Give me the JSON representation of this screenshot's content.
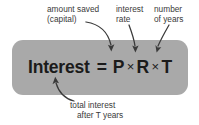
{
  "canvas": {
    "width": 199,
    "height": 125,
    "background": "#ffffff"
  },
  "formula_box": {
    "fill": "#a9a9a9",
    "corner_radius": 11
  },
  "formula": {
    "subject": "Interest",
    "equals": "=",
    "principal": "P",
    "times_1": "×",
    "rate": "R",
    "times_2": "×",
    "time": "T",
    "full_text": "Interest = P × R × T",
    "text_color": "#1b1b1b"
  },
  "callouts": {
    "capital": {
      "line1": "amount saved",
      "line2": "(capital)",
      "points_to": "P",
      "arrow": "curved-arrow-down"
    },
    "rate": {
      "line1": "interest",
      "line2": "rate",
      "points_to": "R",
      "arrow": "curved-arrow-down"
    },
    "years": {
      "line1": "number",
      "line2": "of years",
      "points_to": "T",
      "arrow": "curved-arrow-down-left"
    },
    "total": {
      "line1": "total interest",
      "line2": "after T years",
      "points_to": "Interest",
      "arrow": "curved-arrow-up"
    },
    "text_color": "#3a3a3a"
  }
}
